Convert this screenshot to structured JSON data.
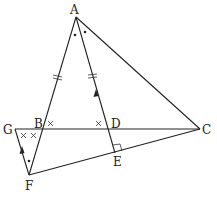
{
  "diagram": {
    "type": "geometry",
    "points": {
      "A": {
        "label": "A",
        "x": 76,
        "y": 17
      },
      "B": {
        "label": "B",
        "x": 42,
        "y": 129
      },
      "C": {
        "label": "C",
        "x": 200,
        "y": 129
      },
      "D": {
        "label": "D",
        "x": 108,
        "y": 129
      },
      "E": {
        "label": "E",
        "x": 115,
        "y": 153
      },
      "F": {
        "label": "F",
        "x": 29,
        "y": 175
      },
      "G": {
        "label": "G",
        "x": 15,
        "y": 129
      }
    },
    "segments": [
      "AF",
      "AC",
      "AE",
      "GC",
      "FC",
      "GF"
    ],
    "markings": {
      "angle_bisector": "angle BAD = angle DAC (dots at A)",
      "equal_segments": "AB = AD (double tick marks)",
      "equal_angles": "angle ABD = angle ADB = angle GBF-related (x marks at B, D, G)",
      "right_angle": "AE perpendicular to FC at E",
      "parallel": "GF parallel to AE (arrows)",
      "dot_at_F": "angle GFB equals angle at A"
    }
  }
}
